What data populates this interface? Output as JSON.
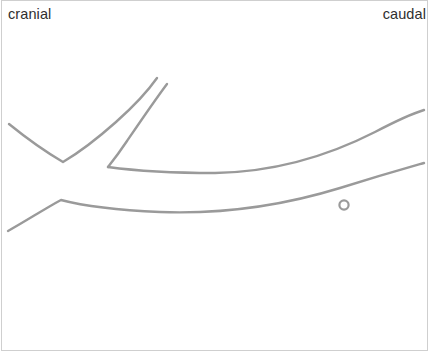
{
  "figure": {
    "type": "anatomical-line-drawing",
    "background_color": "#ffffff",
    "frame": {
      "visible": true,
      "border_color": "#cfcfcf"
    },
    "labels": {
      "cranial": "cranial",
      "caudal": "caudal",
      "text_color": "#2f2f2f"
    },
    "stroke": {
      "color": "#9a9a9a",
      "width": 2.4,
      "linecap": "round",
      "linejoin": "round"
    },
    "marker": {
      "name": "small-ring-marker",
      "shape": "circle-outline",
      "center_x": 344,
      "center_y": 205,
      "radius": 4.6,
      "stroke_width": 2.2,
      "color": "#9a9a9a"
    },
    "paths": [
      {
        "name": "upper-left-descending-branch",
        "d": "M 9,124 C 25,137 46,152 63,162 C 80,152 98,138 116,122 C 134,106 150,88 157,78"
      },
      {
        "name": "upper-inner-parallel-branch",
        "d": "M 167,84 C 155,100 140,122 127,141 C 119,153 112,162 108,167"
      },
      {
        "name": "long-upper-sweeping-curve",
        "d": "M 108,167 C 130,170 170,173 215,173 C 275,172 330,155 375,132 C 398,120 414,113 424,110"
      },
      {
        "name": "long-lower-sweeping-curve",
        "d": "M 8,231 C 26,221 46,208 61,200 C 80,205 115,210 160,212 C 215,214 275,208 340,188 C 385,174 410,167 424,163"
      }
    ]
  }
}
